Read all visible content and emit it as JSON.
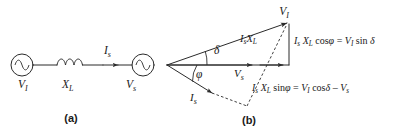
{
  "figure": {
    "background_color": "#ffffff",
    "ink_color": "#2b2b2b",
    "panels": [
      {
        "id": "a",
        "caption": "(a)",
        "title": "circuit-diagram"
      },
      {
        "id": "b",
        "caption": "(b)",
        "title": "phasor-diagram"
      }
    ]
  },
  "panel_a": {
    "caption": "(a)",
    "source_left": {
      "symbol": "ac-source",
      "label_main": "V",
      "label_sub": "I"
    },
    "inductor": {
      "symbol": "inductor-coil",
      "loops": 3,
      "label_main": "X",
      "label_sub": "L"
    },
    "current": {
      "label_main": "I",
      "label_sub": "s",
      "arrow": "right"
    },
    "source_right": {
      "symbol": "ac-source",
      "label_main": "V",
      "label_sub": "s"
    }
  },
  "panel_b": {
    "caption": "(b)",
    "vertex_label": {
      "main": "V",
      "sub": "I"
    },
    "vs_label": {
      "main": "V",
      "sub": "s"
    },
    "is_label": {
      "main": "I",
      "sub": "s"
    },
    "isxl_label": {
      "main": "I",
      "sub1": "s",
      "main2": "X",
      "sub2": "L"
    },
    "angle_delta": "δ",
    "angle_phi": "φ",
    "eq_vertical": {
      "parts": [
        "I",
        "s",
        "X",
        "L",
        " cos",
        "φ",
        " = ",
        "V",
        "I",
        " sin ",
        "δ"
      ],
      "text": "Is XL cosφ = VI sin δ"
    },
    "eq_diagonal": {
      "parts": [
        "I",
        "s",
        "X",
        "L",
        " sin",
        "φ",
        " = ",
        "V",
        "I",
        " cos",
        "δ",
        " – ",
        "V",
        "s"
      ],
      "text": "Is XL sinφ = VI cosδ – Vs"
    }
  }
}
